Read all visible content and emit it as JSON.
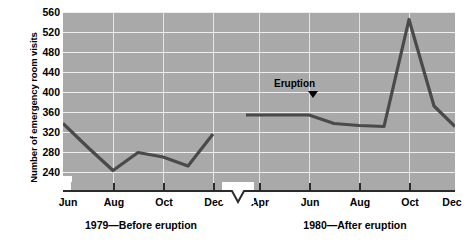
{
  "chart_data": {
    "type": "line",
    "title": "",
    "xlabel": "",
    "ylabel": "Number of emergency room visits",
    "ylim": [
      240,
      560
    ],
    "y_axis_break": true,
    "y_break_label": "0",
    "yticks": [
      560,
      520,
      480,
      440,
      400,
      360,
      320,
      280,
      240
    ],
    "grid": true,
    "legend": "none",
    "x_axis_break": true,
    "annotations": [
      {
        "text": "Eruption",
        "x_category": "Jun",
        "panel": "1980",
        "marker": "down-triangle"
      }
    ],
    "panels": [
      {
        "caption": "1979—Before eruption",
        "tick_labels": [
          "Jun",
          "Aug",
          "Oct",
          "Dec"
        ],
        "categories": [
          "Jun",
          "Jul",
          "Aug",
          "Sep",
          "Oct",
          "Nov",
          "Dec"
        ],
        "values": [
          337,
          289,
          243,
          279,
          270,
          252,
          316
        ]
      },
      {
        "caption": "1980—After eruption",
        "tick_labels": [
          "Apr",
          "Jun",
          "Aug",
          "Oct",
          "Dec"
        ],
        "categories": [
          "Apr",
          "Jun",
          "Jul",
          "Aug",
          "Sep",
          "Oct",
          "Nov",
          "Dec"
        ],
        "values": [
          354,
          354,
          337,
          333,
          331,
          545,
          372,
          331
        ]
      }
    ],
    "colors": {
      "plot_background": "#a9a9a9",
      "gridline": "#eeeeee",
      "series_line": "#4a4a4a",
      "axis": "#2b2b2b",
      "page_background": "#ffffff",
      "text": "#000000"
    }
  },
  "axis": {
    "y_title": "Number of emergency room visits",
    "y_labels": [
      "560",
      "520",
      "480",
      "440",
      "400",
      "360",
      "320",
      "280",
      "240",
      "0"
    ],
    "x_labels_1979": [
      "Jun",
      "Aug",
      "Oct",
      "Dec"
    ],
    "x_labels_1980": [
      "Apr",
      "Jun",
      "Aug",
      "Oct",
      "Dec"
    ]
  },
  "captions": {
    "left": "1979—Before eruption",
    "right": "1980—After eruption"
  },
  "annotation": {
    "eruption_label": "Eruption"
  }
}
